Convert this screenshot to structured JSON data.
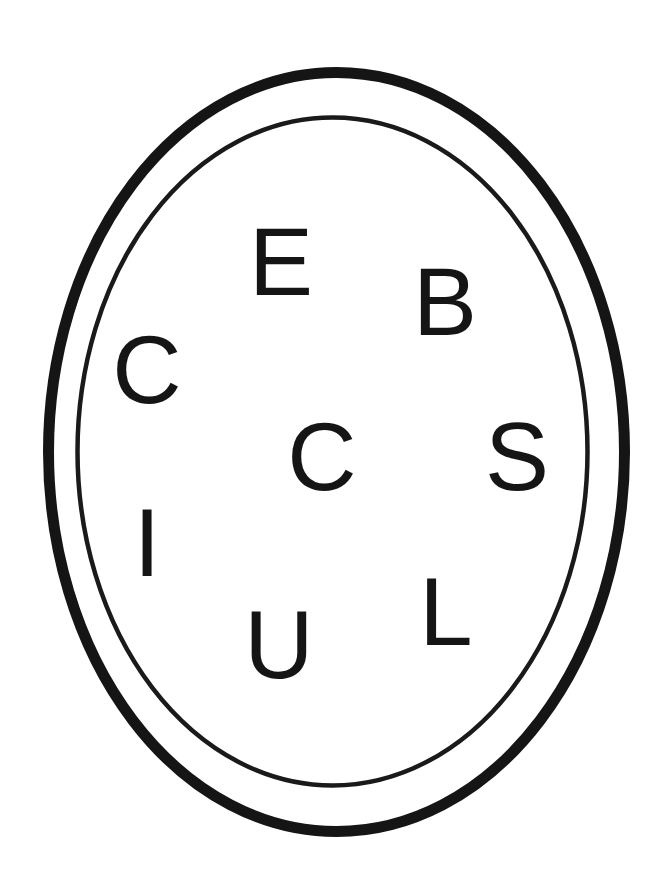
{
  "diagram": {
    "type": "letter-oval-puzzle",
    "colors": {
      "background": "#ffffff",
      "stroke": "#151515",
      "text": "#151515"
    },
    "outer_oval": {
      "cx": 336.5,
      "cy": 452,
      "rx": 288,
      "ry": 379.5
    },
    "inner_oval": {
      "cx": 332.5,
      "cy": 451.5,
      "rx": 255,
      "ry": 334
    },
    "letters": [
      {
        "char": "E",
        "x": 281,
        "y": 295
      },
      {
        "char": "B",
        "x": 445,
        "y": 335
      },
      {
        "char": "C",
        "x": 147,
        "y": 403
      },
      {
        "char": "C",
        "x": 322,
        "y": 490
      },
      {
        "char": "S",
        "x": 517,
        "y": 490
      },
      {
        "char": "I",
        "x": 147,
        "y": 576
      },
      {
        "char": "U",
        "x": 279,
        "y": 678
      },
      {
        "char": "L",
        "x": 446,
        "y": 645
      }
    ]
  }
}
